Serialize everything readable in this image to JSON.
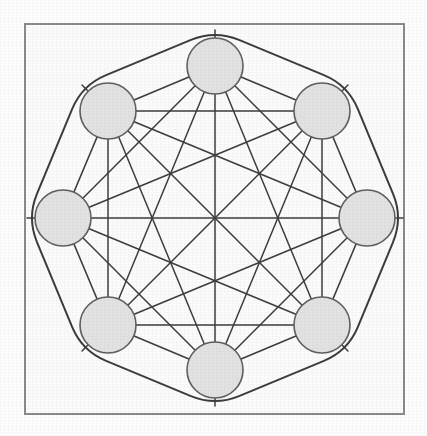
{
  "figure": {
    "kind": "node-link-diagram",
    "canvas": {
      "width": 427,
      "height": 436,
      "background": "#fdfdfd"
    },
    "frame": {
      "name": "figure-border",
      "x": 25,
      "y": 24,
      "width": 379,
      "height": 390,
      "stroke": "#8a8a8a",
      "stroke_width": 2,
      "fill": "#fbfbfb"
    },
    "style": {
      "node_fill": "#e2e2e2",
      "node_stroke": "#5e5e5e",
      "node_stroke_width": 1.6,
      "node_radius": 28,
      "edge_stroke": "#3c3c3c",
      "edge_stroke_width": 1.5,
      "ring_stroke": "#3c3c3c",
      "ring_stroke_width": 2,
      "ring_corner_radius": 26
    },
    "layout": {
      "center_x": 215,
      "center_y": 218,
      "circle_radius": 152,
      "node_count": 8,
      "start_angle_deg": -90,
      "ring_offset": 36
    },
    "nodes": [
      {
        "id": "n0",
        "label": "",
        "angle_deg": -90,
        "cx": 215,
        "cy": 66
      },
      {
        "id": "n1",
        "label": "",
        "angle_deg": -45,
        "cx": 322,
        "cy": 111
      },
      {
        "id": "n2",
        "label": "",
        "angle_deg": 0,
        "cx": 367,
        "cy": 218
      },
      {
        "id": "n3",
        "label": "",
        "angle_deg": 45,
        "cx": 322,
        "cy": 325
      },
      {
        "id": "n4",
        "label": "",
        "angle_deg": 90,
        "cx": 215,
        "cy": 370
      },
      {
        "id": "n5",
        "label": "",
        "angle_deg": 135,
        "cx": 108,
        "cy": 325
      },
      {
        "id": "n6",
        "label": "",
        "angle_deg": 180,
        "cx": 63,
        "cy": 218
      },
      {
        "id": "n7",
        "label": "",
        "angle_deg": -135,
        "cx": 108,
        "cy": 111
      }
    ],
    "edges": [
      [
        "n0",
        "n1"
      ],
      [
        "n0",
        "n2"
      ],
      [
        "n0",
        "n3"
      ],
      [
        "n0",
        "n4"
      ],
      [
        "n0",
        "n5"
      ],
      [
        "n0",
        "n6"
      ],
      [
        "n0",
        "n7"
      ],
      [
        "n1",
        "n2"
      ],
      [
        "n1",
        "n3"
      ],
      [
        "n1",
        "n4"
      ],
      [
        "n1",
        "n5"
      ],
      [
        "n1",
        "n6"
      ],
      [
        "n1",
        "n7"
      ],
      [
        "n2",
        "n3"
      ],
      [
        "n2",
        "n4"
      ],
      [
        "n2",
        "n5"
      ],
      [
        "n2",
        "n6"
      ],
      [
        "n2",
        "n7"
      ],
      [
        "n3",
        "n4"
      ],
      [
        "n3",
        "n5"
      ],
      [
        "n3",
        "n6"
      ],
      [
        "n3",
        "n7"
      ],
      [
        "n4",
        "n5"
      ],
      [
        "n4",
        "n6"
      ],
      [
        "n4",
        "n7"
      ],
      [
        "n5",
        "n6"
      ],
      [
        "n5",
        "n7"
      ],
      [
        "n6",
        "n7"
      ]
    ],
    "edge_count": 28,
    "ring": {
      "name": "outer-ring-path",
      "description": "rounded octagon drawn outside the node circles"
    },
    "labels": []
  }
}
